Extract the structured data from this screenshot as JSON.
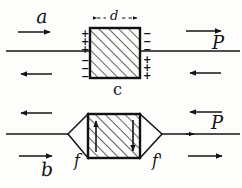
{
  "figure": {
    "background_color": "#fdfdfc",
    "ink_color": "#141414",
    "panels": [
      {
        "id": "top-panel",
        "name": "panel-c",
        "caption": "c",
        "dimension_label": "d",
        "field_label": "a",
        "polarization_label": "P",
        "left_face_charges": "+ + + - - -",
        "right_face_charges": "- - - + + +",
        "arrow_top_direction": "right",
        "arrow_bottom_direction": "left"
      },
      {
        "id": "bottom-panel",
        "name": "panel-b",
        "caption": "b",
        "left_flux_label": "f",
        "right_flux_label": "f'",
        "polarization_label": "P",
        "inner_arrow_left_direction": "up",
        "inner_arrow_right_direction": "down",
        "arrow_top_direction": "left",
        "arrow_bottom_direction": "right"
      }
    ],
    "labels": {
      "a": "a",
      "b": "b",
      "c": "c",
      "d": "d",
      "f": "f",
      "f_prime": "f'",
      "P_top": "P",
      "P_bottom": "P"
    },
    "charges": {
      "left_face": [
        "+",
        "+",
        "+",
        "−",
        "−",
        "−"
      ],
      "right_face": [
        "−",
        "−",
        "−",
        "+",
        "+",
        "+"
      ]
    },
    "geometry": {
      "top_box": {
        "x": 90,
        "y": 28,
        "w": 50,
        "h": 50
      },
      "bottom_box": {
        "x": 88,
        "y": 114,
        "w": 52,
        "h": 44
      },
      "top_axis_y": 51,
      "bottom_axis_y": 134
    }
  }
}
